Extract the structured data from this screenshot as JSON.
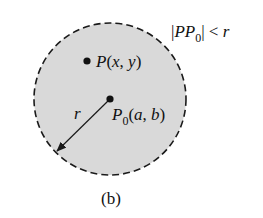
{
  "figure": {
    "caption": "(b)",
    "colors": {
      "background": "#ffffff",
      "disk_fill": "#d9d9d9",
      "stroke": "#1a1a1a"
    },
    "disk": {
      "center": [
        110,
        99
      ],
      "radius": 76,
      "boundary": "dashed"
    },
    "condition": {
      "bar_open": "|",
      "pp": "PP",
      "sub": "0",
      "bar_close": "|",
      "rel": " < ",
      "r": "r"
    },
    "point_p": {
      "name": "P",
      "args": "(x, y)"
    },
    "point_p0": {
      "name": "P",
      "sub": "0",
      "args": "(a, b)"
    },
    "radius_label": "r"
  }
}
